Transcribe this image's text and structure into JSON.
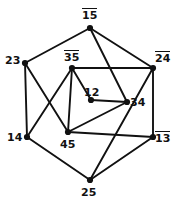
{
  "figure": {
    "kind": "graph-diagram",
    "width": 182,
    "height": 206,
    "background_color": "#ffffff",
    "edge_color": "#111111",
    "vertex_color": "#111111",
    "label_color": "#111111"
  },
  "chart_data": {
    "type": "diagram",
    "title": "",
    "vertices": [
      {
        "id": "v15",
        "label": "15",
        "overline": true,
        "x": 90,
        "y": 28,
        "label_x": 82,
        "label_y": 8,
        "ring": "outer"
      },
      {
        "id": "v24",
        "label": "24",
        "overline": true,
        "x": 153,
        "y": 68,
        "label_x": 155,
        "label_y": 51,
        "ring": "outer"
      },
      {
        "id": "v13",
        "label": "13",
        "overline": true,
        "x": 153,
        "y": 137,
        "label_x": 155,
        "label_y": 131,
        "ring": "outer"
      },
      {
        "id": "v25",
        "label": "25",
        "overline": false,
        "x": 90,
        "y": 180,
        "label_x": 81,
        "label_y": 186,
        "ring": "outer"
      },
      {
        "id": "v14",
        "label": "14",
        "overline": false,
        "x": 27,
        "y": 137,
        "label_x": 7,
        "label_y": 131,
        "ring": "outer"
      },
      {
        "id": "v23",
        "label": "23",
        "overline": false,
        "x": 25,
        "y": 63,
        "label_x": 5,
        "label_y": 54,
        "ring": "outer"
      },
      {
        "id": "v35",
        "label": "35",
        "overline": true,
        "x": 72,
        "y": 68,
        "label_x": 64,
        "label_y": 50,
        "ring": "inner"
      },
      {
        "id": "v12",
        "label": "12",
        "overline": false,
        "x": 91,
        "y": 100,
        "label_x": 84,
        "label_y": 86,
        "ring": "inner"
      },
      {
        "id": "v34",
        "label": "34",
        "overline": false,
        "x": 127,
        "y": 102,
        "label_x": 130,
        "label_y": 96,
        "ring": "inner"
      },
      {
        "id": "v45",
        "label": "45",
        "overline": false,
        "x": 68,
        "y": 132,
        "label_x": 60,
        "label_y": 138,
        "ring": "inner"
      }
    ],
    "edges": [
      {
        "from": "v15",
        "to": "v23",
        "kind": "outer"
      },
      {
        "from": "v15",
        "to": "v24",
        "kind": "outer"
      },
      {
        "from": "v24",
        "to": "v13",
        "kind": "outer"
      },
      {
        "from": "v13",
        "to": "v25",
        "kind": "outer"
      },
      {
        "from": "v25",
        "to": "v14",
        "kind": "outer"
      },
      {
        "from": "v14",
        "to": "v23",
        "kind": "outer"
      },
      {
        "from": "v35",
        "to": "v12",
        "kind": "inner"
      },
      {
        "from": "v12",
        "to": "v34",
        "kind": "inner"
      },
      {
        "from": "v34",
        "to": "v45",
        "kind": "inner"
      },
      {
        "from": "v45",
        "to": "v35",
        "kind": "inner"
      },
      {
        "from": "v35",
        "to": "v24",
        "kind": "spoke"
      },
      {
        "from": "v45",
        "to": "v13",
        "kind": "spoke"
      },
      {
        "from": "v23",
        "to": "v45",
        "kind": "chord"
      },
      {
        "from": "v15",
        "to": "v34",
        "kind": "chord"
      },
      {
        "from": "v25",
        "to": "v24",
        "kind": "chord"
      },
      {
        "from": "v14",
        "to": "v35",
        "kind": "chord"
      }
    ]
  }
}
